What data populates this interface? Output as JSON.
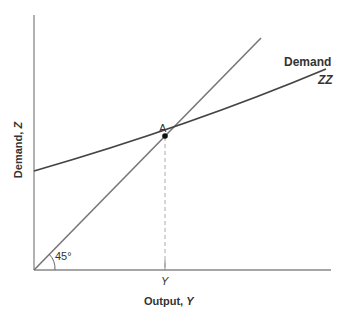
{
  "diagram": {
    "x_axis_label": "Output, ",
    "x_axis_var": "Y",
    "y_axis_label": "Demand, ",
    "y_axis_var": "Z",
    "curve_label_line1": "Demand",
    "curve_label_line2": "ZZ",
    "point_label": "A",
    "angle_label": "45°",
    "x_tick_label": "Y",
    "colors": {
      "axis": "#888888",
      "line45": "#777777",
      "zz": "#444444",
      "text": "#333333"
    }
  }
}
